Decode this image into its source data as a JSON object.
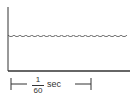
{
  "diagram": {
    "type": "ripple-waveform",
    "colors": {
      "line": "#333333",
      "background": "#ffffff"
    },
    "axes": {
      "y_axis": {
        "x": 8,
        "y_top": 7,
        "y_bottom": 71
      },
      "x_axis": {
        "y": 71,
        "x_left": 8,
        "x_right": 130
      }
    },
    "waveform": {
      "baseline_y": 33,
      "ripple_depth": 4,
      "x_start": 8,
      "x_end": 127,
      "scallop_count": 20
    },
    "time_marker": {
      "numerator": "1",
      "denominator": "60",
      "unit": "sec",
      "x_left": 11,
      "x_right": 91,
      "y": 84
    }
  }
}
